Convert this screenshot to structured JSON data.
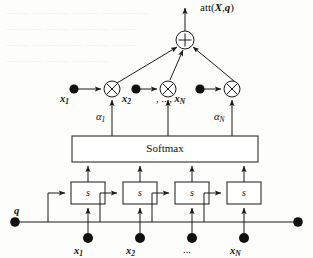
{
  "figure": {
    "type": "attention-mechanism-diagram",
    "output_label": "att(X,q)",
    "output_label_parts": {
      "fn": "att(",
      "x": "X",
      "comma": ",",
      "q": "q",
      "close": ")"
    },
    "sum_node": "+",
    "product_node": "×",
    "softmax_label": "Softmax",
    "score_box_label": "s",
    "query_label": "q",
    "ellipsis": "...",
    "top_inputs": [
      {
        "name": "x",
        "sub": "1"
      },
      {
        "name": "x",
        "sub": "2"
      },
      {
        "name": "x",
        "sub": "N"
      }
    ],
    "top_ellipsis": ", ..., ",
    "weights": [
      {
        "name": "α",
        "sub": "1"
      },
      {
        "name": "α",
        "sub": "N"
      }
    ],
    "bottom_inputs": [
      {
        "name": "x",
        "sub": "1"
      },
      {
        "name": "x",
        "sub": "2"
      },
      {
        "name": "...",
        "sub": ""
      },
      {
        "name": "x",
        "sub": "N"
      }
    ],
    "score_boxes": [
      "s",
      "s",
      "s",
      "s"
    ],
    "colors": {
      "stroke": "#1a1a1a",
      "node_fill": "#111111",
      "box_fill": "#ffffff",
      "background": "#fdfdfb"
    }
  },
  "bleed_through": [
    "—— ——— —— ————",
    "——— —— ——— ——",
    "—— ———— —— ——",
    "——— —— ———"
  ]
}
